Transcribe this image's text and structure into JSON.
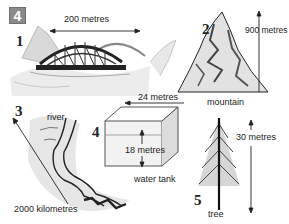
{
  "exercise": {
    "number": "4"
  },
  "items": [
    {
      "index": "1",
      "name": "bridge",
      "measurement": "200 metres"
    },
    {
      "index": "2",
      "name": "mountain",
      "label": "mountain",
      "measurement": "900 metres"
    },
    {
      "index": "3",
      "name": "river",
      "label": "river",
      "measurement": "2000 kilometres"
    },
    {
      "index": "4",
      "name": "water tank",
      "label": "water tank",
      "measurement_width": "24 metres",
      "measurement_height": "18 metres"
    },
    {
      "index": "5",
      "name": "tree",
      "label": "tree",
      "measurement": "30 metres"
    }
  ],
  "colors": {
    "badge": "#8a8a8a",
    "ink": "#222222"
  }
}
